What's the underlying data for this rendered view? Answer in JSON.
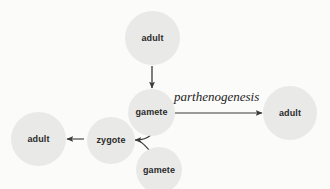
{
  "diagram": {
    "background_color": "#fbfbfa",
    "node_fill_color": "#e9e9e7",
    "stroke_color": "#3a3a3a",
    "nodes": [
      {
        "id": "adult-top",
        "label": "adult",
        "cx": 152,
        "cy": 38,
        "r": 27
      },
      {
        "id": "gamete-upper",
        "label": "gamete",
        "cx": 151,
        "cy": 112,
        "r": 23
      },
      {
        "id": "adult-right",
        "label": "adult",
        "cx": 290,
        "cy": 113,
        "r": 27
      },
      {
        "id": "adult-left",
        "label": "adult",
        "cx": 38,
        "cy": 139,
        "r": 27
      },
      {
        "id": "zygote",
        "label": "zygote",
        "cx": 111,
        "cy": 140,
        "r": 24
      },
      {
        "id": "gamete-lower",
        "label": "gamete",
        "cx": 159,
        "cy": 170,
        "r": 23
      }
    ],
    "edges": [
      {
        "id": "adult-top-to-gamete",
        "from": "adult-top",
        "to": "gamete-upper",
        "label": ""
      },
      {
        "id": "gamete-to-adult-right",
        "from": "gamete-upper",
        "to": "adult-right",
        "label": "parthenogenesis"
      },
      {
        "id": "gamete-upper-to-zygote",
        "from": "gamete-upper",
        "to": "zygote",
        "label": ""
      },
      {
        "id": "gamete-lower-to-zygote",
        "from": "gamete-lower",
        "to": "zygote",
        "label": ""
      },
      {
        "id": "zygote-to-adult-left",
        "from": "zygote",
        "to": "adult-left",
        "label": ""
      }
    ]
  }
}
